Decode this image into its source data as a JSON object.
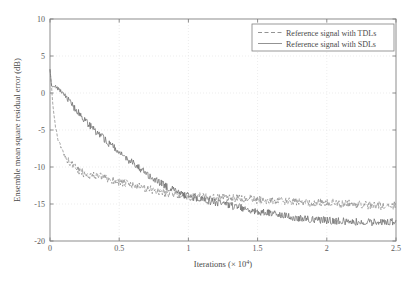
{
  "chart_data": {
    "type": "line",
    "title": "",
    "xlabel": "Iterations (× 10⁴)",
    "xlabel_base": "Iterations (× 10",
    "xlabel_exp": "4",
    "xlabel_tail": ")",
    "ylabel": "Ensemble mean square residual error (dB)",
    "xlim": [
      0,
      2.5
    ],
    "ylim": [
      -20,
      10
    ],
    "xticks": [
      0,
      0.5,
      1,
      1.5,
      2,
      2.5
    ],
    "xticklabels": [
      "0",
      "0.5",
      "1",
      "1.5",
      "2",
      "2.5"
    ],
    "yticks": [
      10,
      5,
      0,
      -5,
      -10,
      -15,
      -20
    ],
    "yticklabels": [
      "10",
      "5",
      "0",
      "-5",
      "-10",
      "-15",
      "-20"
    ],
    "grid": true,
    "grid_style": "dotted",
    "grid_color": "#e0e0e0",
    "axis_color": "#808080",
    "legend_position": "upper right",
    "legend": [
      {
        "name": "Reference signal with TDLs",
        "style": "dashed",
        "color": "#808080"
      },
      {
        "name": "Reference signal with SDLs",
        "style": "solid",
        "color": "#808080"
      }
    ],
    "series": [
      {
        "name": "Reference signal with TDLs",
        "style": "dashed",
        "color": "#8a8a8a",
        "x": [
          0.0,
          0.01,
          0.02,
          0.03,
          0.04,
          0.05,
          0.06,
          0.07,
          0.08,
          0.09,
          0.1,
          0.12,
          0.14,
          0.16,
          0.18,
          0.2,
          0.22,
          0.24,
          0.26,
          0.28,
          0.3,
          0.32,
          0.34,
          0.36,
          0.38,
          0.4,
          0.42,
          0.44,
          0.46,
          0.48,
          0.5,
          0.52,
          0.54,
          0.56,
          0.58,
          0.6,
          0.62,
          0.64,
          0.66,
          0.68,
          0.7,
          0.72,
          0.74,
          0.76,
          0.78,
          0.8,
          0.82,
          0.84,
          0.86,
          0.88,
          0.9,
          0.92,
          0.94,
          0.96,
          0.98,
          1.0,
          1.05,
          1.1,
          1.15,
          1.2,
          1.25,
          1.3,
          1.35,
          1.4,
          1.45,
          1.5,
          1.55,
          1.6,
          1.65,
          1.7,
          1.75,
          1.8,
          1.85,
          1.9,
          1.95,
          2.0,
          2.05,
          2.1,
          2.15,
          2.2,
          2.25,
          2.3,
          2.35,
          2.4,
          2.45,
          2.5
        ],
        "y": [
          3.2,
          1.2,
          -1.5,
          -3.2,
          -4.6,
          -5.6,
          -6.3,
          -6.9,
          -7.4,
          -7.8,
          -8.2,
          -8.8,
          -9.3,
          -9.7,
          -10.1,
          -10.4,
          -10.6,
          -10.8,
          -10.9,
          -11.0,
          -11.1,
          -11.2,
          -11.15,
          -11.3,
          -11.4,
          -11.5,
          -11.6,
          -11.75,
          -11.8,
          -11.9,
          -12.0,
          -12.1,
          -12.2,
          -12.3,
          -12.35,
          -12.5,
          -12.6,
          -12.65,
          -12.8,
          -12.9,
          -13.0,
          -13.05,
          -13.1,
          -13.2,
          -13.3,
          -13.35,
          -13.4,
          -13.5,
          -13.55,
          -13.6,
          -13.7,
          -13.75,
          -13.8,
          -13.85,
          -13.9,
          -14.0,
          -14.05,
          -13.95,
          -14.1,
          -14.2,
          -14.15,
          -14.3,
          -14.2,
          -14.35,
          -14.3,
          -14.5,
          -14.4,
          -14.6,
          -14.5,
          -14.7,
          -14.6,
          -14.8,
          -14.7,
          -14.85,
          -14.75,
          -14.9,
          -14.8,
          -15.0,
          -14.9,
          -15.1,
          -15.0,
          -15.2,
          -15.1,
          -15.3,
          -15.1,
          -15.3
        ]
      },
      {
        "name": "Reference signal with SDLs",
        "style": "solid",
        "color": "#6e6e6e",
        "x": [
          0.0,
          0.01,
          0.02,
          0.03,
          0.05,
          0.07,
          0.09,
          0.1,
          0.12,
          0.14,
          0.16,
          0.18,
          0.2,
          0.22,
          0.24,
          0.26,
          0.28,
          0.3,
          0.32,
          0.34,
          0.36,
          0.38,
          0.4,
          0.42,
          0.44,
          0.46,
          0.48,
          0.5,
          0.52,
          0.54,
          0.56,
          0.58,
          0.6,
          0.62,
          0.64,
          0.66,
          0.68,
          0.7,
          0.72,
          0.74,
          0.76,
          0.78,
          0.8,
          0.82,
          0.84,
          0.86,
          0.88,
          0.9,
          0.92,
          0.94,
          0.96,
          0.98,
          1.0,
          1.05,
          1.1,
          1.15,
          1.2,
          1.25,
          1.3,
          1.35,
          1.4,
          1.45,
          1.5,
          1.55,
          1.6,
          1.65,
          1.7,
          1.75,
          1.8,
          1.85,
          1.9,
          1.95,
          2.0,
          2.05,
          2.1,
          2.15,
          2.2,
          2.25,
          2.3,
          2.35,
          2.4,
          2.45,
          2.5
        ],
        "y": [
          3.3,
          1.0,
          0.8,
          0.9,
          0.7,
          0.4,
          0.1,
          -0.1,
          -0.6,
          -1.1,
          -1.6,
          -2.1,
          -2.5,
          -3.0,
          -3.4,
          -3.8,
          -4.2,
          -4.6,
          -5.0,
          -5.4,
          -5.7,
          -6.0,
          -6.4,
          -6.7,
          -7.0,
          -7.3,
          -7.7,
          -8.0,
          -8.3,
          -8.6,
          -8.9,
          -9.2,
          -9.5,
          -9.8,
          -10.1,
          -10.4,
          -10.7,
          -11.0,
          -11.2,
          -11.5,
          -11.7,
          -12.0,
          -12.2,
          -12.4,
          -12.6,
          -12.8,
          -13.0,
          -13.2,
          -13.4,
          -13.5,
          -13.7,
          -13.85,
          -14.0,
          -14.2,
          -14.4,
          -14.6,
          -14.8,
          -15.0,
          -15.2,
          -15.4,
          -15.6,
          -15.8,
          -16.0,
          -16.2,
          -16.3,
          -16.5,
          -16.6,
          -16.8,
          -16.9,
          -17.0,
          -17.1,
          -17.2,
          -17.2,
          -17.3,
          -17.3,
          -17.4,
          -17.4,
          -17.5,
          -17.45,
          -17.5,
          -17.4,
          -17.5,
          -17.3
        ]
      }
    ],
    "noise_amplitude": {
      "dashed": 0.55,
      "solid": 0.5
    }
  }
}
